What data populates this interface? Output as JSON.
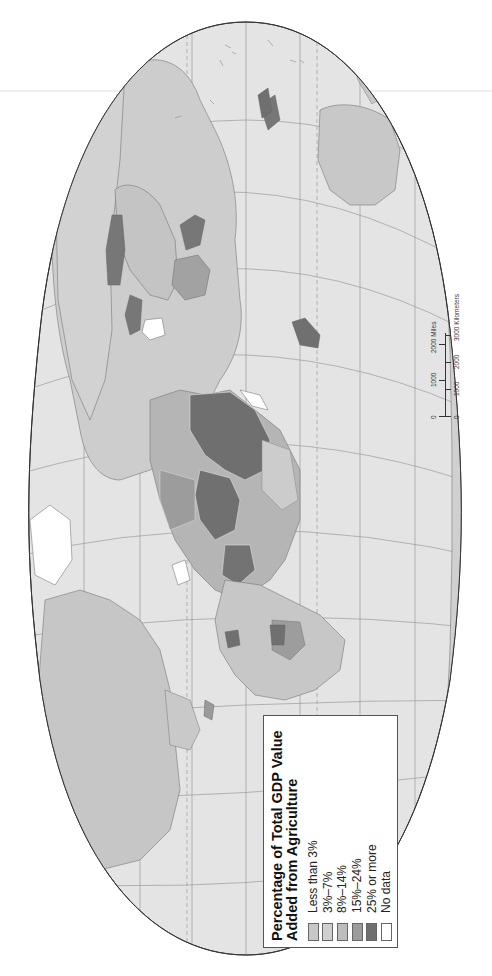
{
  "map": {
    "title": "Percentage of Total GDP Value Added from Agriculture",
    "orientation": "rotated 90 degrees clockwise (north to the left)",
    "projection": "oval world projection with graticule",
    "colors": {
      "ocean": "#e3e3e3",
      "outline": "#333333",
      "graticule": "#8a8a8a"
    }
  },
  "legend": {
    "title_line1": "Percentage of Total GDP Value",
    "title_line2": "Added from Agriculture",
    "items": [
      {
        "label": "Less than 3%",
        "color": "#c7c7c7"
      },
      {
        "label": "3%–7%",
        "color": "#cfcfcf"
      },
      {
        "label": "8%–14%",
        "color": "#bdbdbd"
      },
      {
        "label": "15%–24%",
        "color": "#9c9c9c"
      },
      {
        "label": "25% or more",
        "color": "#6f6f6f"
      },
      {
        "label": "No data",
        "color": "#ffffff"
      }
    ]
  },
  "scale_bar": {
    "miles_ticks": [
      "0",
      "1000",
      "2000 Miles"
    ],
    "km_ticks": [
      "0",
      "1000",
      "2000",
      "3000 Kilometers"
    ]
  }
}
